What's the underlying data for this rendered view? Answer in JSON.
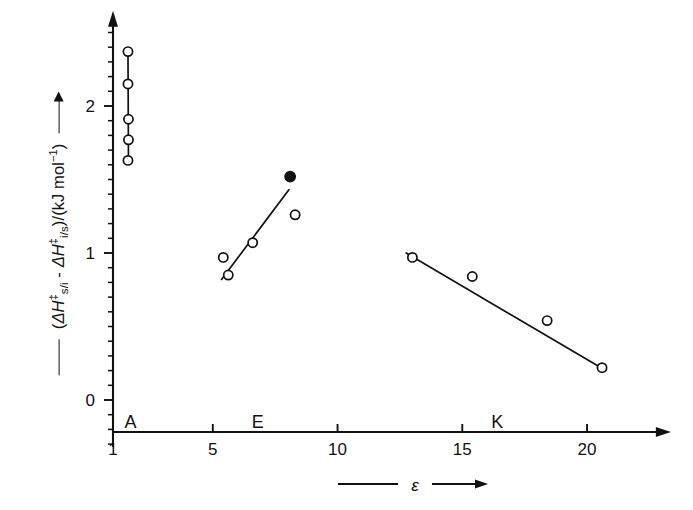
{
  "figure": {
    "background_color": "#ffffff",
    "ink_color": "#111111",
    "width": 693,
    "height": 510
  },
  "axes": {
    "y": {
      "label_parts": {
        "open_paren": "(",
        "delta_h_1": "ΔH",
        "dagger_1": "‡",
        "sub_1": "s/i",
        "minus": " - ",
        "delta_h_2": "ΔH",
        "dagger_2": "‡",
        "sub_2": "i/s",
        "close_units": ")/(kJ mol",
        "exponent": "−1",
        "tail": ")"
      },
      "label_plain": "(ΔH‡s/i - ΔH‡i/s)/(kJ mol⁻¹)",
      "tick_labels": [
        "0",
        "1",
        "2"
      ],
      "tick_values": [
        0,
        1,
        2
      ],
      "minor_tick_step": 0.1,
      "range": [
        -0.32,
        2.62
      ],
      "has_arrow": true,
      "has_leader_rule": true
    },
    "x": {
      "label": "ε",
      "tick_labels": [
        "1",
        "5",
        "10",
        "15",
        "20"
      ],
      "tick_values": [
        1,
        5,
        10,
        15,
        20
      ],
      "range": [
        1,
        23.2
      ],
      "has_arrow": true,
      "has_leader_rule": true
    }
  },
  "group_labels": [
    {
      "text": "A",
      "x": 1.7,
      "y": -0.1
    },
    {
      "text": "E",
      "x": 6.8,
      "y": -0.1
    },
    {
      "text": "K",
      "x": 16.4,
      "y": -0.1
    }
  ],
  "chart_data": {
    "type": "scatter",
    "title": "",
    "xlabel": "ε",
    "ylabel": "(ΔH‡s/i - ΔH‡i/s)/(kJ mol⁻¹)",
    "xlim": [
      1,
      23.2
    ],
    "ylim": [
      -0.32,
      2.62
    ],
    "grid": false,
    "legend": "none",
    "xticks": [
      1,
      5,
      10,
      15,
      20
    ],
    "yticks": [
      0,
      1,
      2
    ],
    "series": [
      {
        "name": "A",
        "marker": "open-circle",
        "has_trend_line": true,
        "trend_line": {
          "x1": 1.6,
          "y1": 2.37,
          "x2": 1.62,
          "y2": 1.63
        },
        "points": [
          {
            "x": 1.6,
            "y": 2.37,
            "filled": false
          },
          {
            "x": 1.6,
            "y": 2.15,
            "filled": false
          },
          {
            "x": 1.62,
            "y": 1.91,
            "filled": false
          },
          {
            "x": 1.62,
            "y": 1.77,
            "filled": false
          },
          {
            "x": 1.6,
            "y": 1.63,
            "filled": false
          }
        ]
      },
      {
        "name": "E",
        "marker": "open-circle",
        "has_trend_line": true,
        "trend_line": {
          "x1": 5.35,
          "y1": 0.82,
          "x2": 8.05,
          "y2": 1.43
        },
        "points": [
          {
            "x": 5.42,
            "y": 0.97,
            "filled": false
          },
          {
            "x": 5.62,
            "y": 0.85,
            "filled": false
          },
          {
            "x": 6.6,
            "y": 1.07,
            "filled": false
          },
          {
            "x": 8.1,
            "y": 1.52,
            "filled": true
          },
          {
            "x": 8.3,
            "y": 1.26,
            "filled": false
          }
        ]
      },
      {
        "name": "K",
        "marker": "open-circle",
        "has_trend_line": true,
        "trend_line": {
          "x1": 12.75,
          "y1": 1.0,
          "x2": 20.75,
          "y2": 0.2
        },
        "points": [
          {
            "x": 13.0,
            "y": 0.97,
            "filled": false
          },
          {
            "x": 15.4,
            "y": 0.84,
            "filled": false
          },
          {
            "x": 18.4,
            "y": 0.54,
            "filled": false
          },
          {
            "x": 20.6,
            "y": 0.22,
            "filled": false
          }
        ]
      }
    ]
  }
}
